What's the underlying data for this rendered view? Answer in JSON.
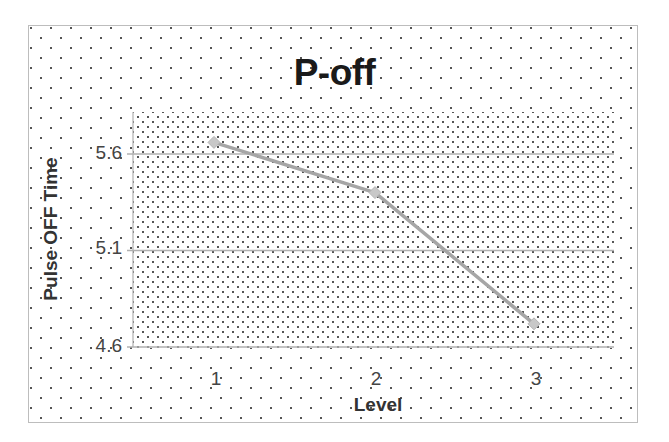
{
  "chart_data": {
    "type": "line",
    "title": "P-off",
    "xlabel": "Level",
    "ylabel": "Pulse OFF Time",
    "categories": [
      "1",
      "2",
      "3"
    ],
    "series": [
      {
        "name": "Pulse OFF Time",
        "values": [
          5.66,
          5.4,
          4.72
        ]
      }
    ],
    "ylim": [
      4.6,
      5.8
    ],
    "yticks": [
      "4.6",
      "5.1",
      "5.6"
    ],
    "grid": true,
    "legend": "none",
    "colors": {
      "line": "#a6a6a6",
      "marker": "#c8c8c8",
      "grid": "#b0b0b0"
    }
  }
}
